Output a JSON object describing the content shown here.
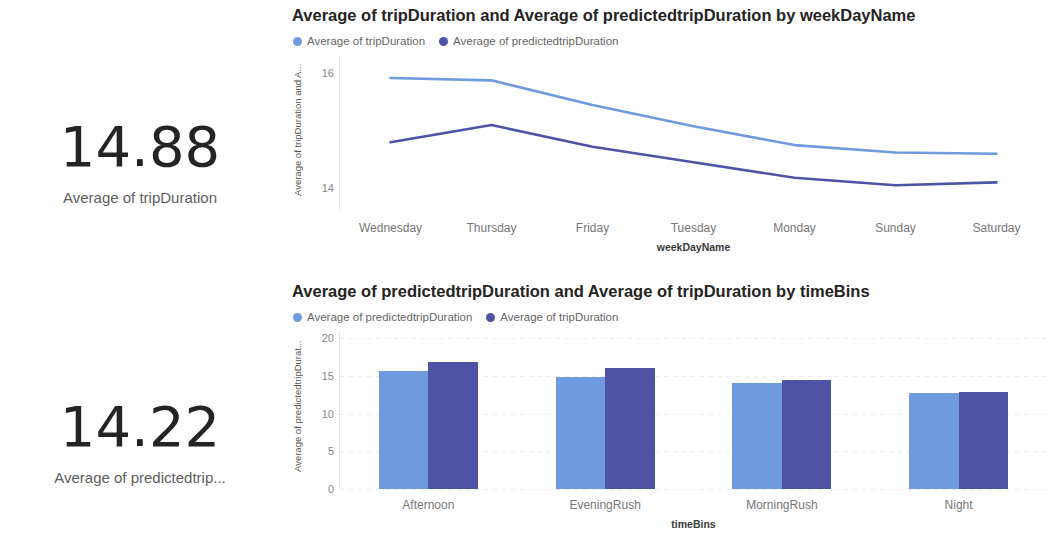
{
  "colors": {
    "series_light": "#6f9ade",
    "series_dark": "#4f53a6",
    "text_dark": "#252423",
    "text_muted": "#605e5c",
    "gridline": "#eeeeee"
  },
  "kpis": [
    {
      "value": "14.88",
      "label": "Average of tripDuration"
    },
    {
      "value": "14.22",
      "label": "Average of predictedtrip..."
    }
  ],
  "visuals": {
    "line": {
      "title": "Average of tripDuration and Average of predictedtripDuration by weekDayName",
      "legend": [
        {
          "label": "Average of tripDuration",
          "color": "#6f9ade"
        },
        {
          "label": "Average of predictedtripDuration",
          "color": "#4f53a6"
        }
      ]
    },
    "bar": {
      "title": "Average of predictedtripDuration and Average of tripDuration by timeBins",
      "legend": [
        {
          "label": "Average of predictedtripDuration",
          "color": "#6f9ade"
        },
        {
          "label": "Average of tripDuration",
          "color": "#4f53a6"
        }
      ]
    }
  },
  "chart_data": [
    {
      "type": "line",
      "title": "Average of tripDuration and Average of predictedtripDuration by weekDayName",
      "xlabel": "weekDayName",
      "ylabel": "Average of tripDuration and A...",
      "categories": [
        "Wednesday",
        "Thursday",
        "Friday",
        "Tuesday",
        "Monday",
        "Sunday",
        "Saturday"
      ],
      "yticks": [
        14,
        16
      ],
      "ylim": [
        13.6,
        16.2
      ],
      "grid": false,
      "legend_position": "top-left",
      "series": [
        {
          "name": "Average of tripDuration",
          "color": "#6f9ade",
          "values": [
            15.92,
            15.88,
            15.45,
            15.08,
            14.75,
            14.62,
            14.6
          ]
        },
        {
          "name": "Average of predictedtripDuration",
          "color": "#4f53a6",
          "values": [
            14.8,
            15.1,
            14.72,
            14.45,
            14.18,
            14.05,
            14.1
          ]
        }
      ]
    },
    {
      "type": "bar",
      "title": "Average of predictedtripDuration and Average of tripDuration by timeBins",
      "xlabel": "timeBins",
      "ylabel": "Average of predictedtripDurat...",
      "categories": [
        "Afternoon",
        "EveningRush",
        "MorningRush",
        "Night"
      ],
      "yticks": [
        0,
        5,
        10,
        15,
        20
      ],
      "ylim": [
        0,
        20
      ],
      "grid": true,
      "legend_position": "top-left",
      "series": [
        {
          "name": "Average of predictedtripDuration",
          "color": "#6f9ade",
          "values": [
            15.6,
            14.9,
            14.1,
            12.7
          ]
        },
        {
          "name": "Average of tripDuration",
          "color": "#4f53a6",
          "values": [
            16.8,
            16.0,
            14.5,
            12.9
          ]
        }
      ]
    }
  ]
}
